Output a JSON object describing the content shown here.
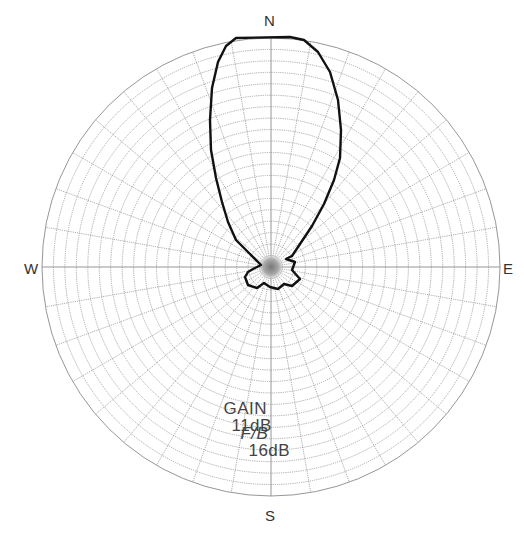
{
  "diagram": {
    "type": "polar-radiation-pattern",
    "compass": {
      "north": "N",
      "east": "E",
      "south": "S",
      "west": "W"
    },
    "stats": [
      {
        "label": "GAIN",
        "value": "11dB",
        "italic": false
      },
      {
        "label": "F/B",
        "value": "16dB",
        "italic": true
      }
    ],
    "grid": {
      "rings": 20,
      "spoke_step_deg": 10
    },
    "colors": {
      "grid": "#8a8a8a",
      "pattern": "#111111",
      "text": "#444444"
    }
  }
}
